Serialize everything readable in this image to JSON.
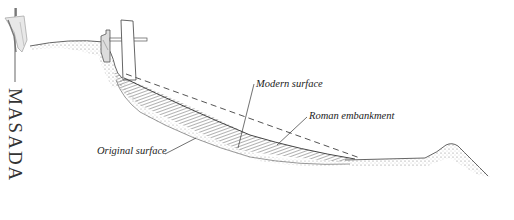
{
  "title": "MASADA",
  "labels": {
    "modern_surface": "Modern surface",
    "roman_embankment": "Roman embankment",
    "original_surface": "Original surface"
  },
  "icons": {
    "banner": "flag-banner-icon"
  },
  "colors": {
    "ink": "#333333",
    "shading": "#888888",
    "background": "#ffffff"
  }
}
